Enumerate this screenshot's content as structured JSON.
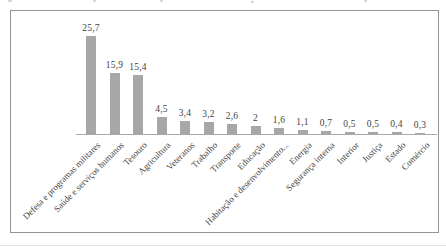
{
  "chart_data": {
    "type": "bar",
    "title": "",
    "xlabel": "",
    "ylabel": "",
    "legend": "none",
    "grid": "off",
    "y_axis_visible": false,
    "decimal_separator": ",",
    "categories": [
      "Defesa e programas militares",
      "Saúde e serviços humanos",
      "Tesouro",
      "Agricultura",
      "Veteranos",
      "Trabalho",
      "Transporte",
      "Educação",
      "Habitação e desenvolvimento...",
      "Energia",
      "Segurança interna",
      "Interior",
      "Justiça",
      "Estado",
      "Comércio"
    ],
    "values": [
      25.7,
      15.9,
      15.4,
      4.5,
      3.4,
      3.2,
      2.6,
      2,
      1.6,
      1.1,
      0.7,
      0.5,
      0.5,
      0.4,
      0.3
    ],
    "value_labels": [
      "25,7",
      "15,9",
      "15,4",
      "4,5",
      "3,4",
      "3,2",
      "2,6",
      "2",
      "1,6",
      "1,1",
      "0,7",
      "0,5",
      "0,5",
      "0,4",
      "0,3"
    ],
    "ylim": [
      0,
      28
    ],
    "colors": {
      "bar": "#a7a7a7",
      "axis": "#a9a9a9",
      "frame_border": "#949494",
      "text": "#3f3f3f",
      "background": "#ffffff"
    }
  }
}
